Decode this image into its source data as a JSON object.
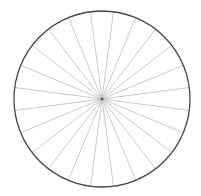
{
  "chart_data": {
    "type": "pie",
    "title": "",
    "categories": [
      "1",
      "2",
      "3",
      "4",
      "5",
      "6",
      "7",
      "8",
      "9",
      "10",
      "11",
      "12",
      "13",
      "14",
      "15",
      "16",
      "17",
      "18",
      "19",
      "20",
      "21",
      "22",
      "23",
      "24"
    ],
    "values": [
      1,
      1,
      1,
      1,
      1,
      1,
      1,
      1,
      1,
      1,
      1,
      1,
      1,
      1,
      1,
      1,
      1,
      1,
      1,
      1,
      1,
      1,
      1,
      1
    ],
    "start_angle_deg": 7.5,
    "slice_fill": "#ffffff",
    "divider_color": "#c8c8c8",
    "outline_color": "#444444",
    "legend": false,
    "labels_visible": false
  },
  "geometry": {
    "cx": 102,
    "cy": 99,
    "r": 88
  }
}
